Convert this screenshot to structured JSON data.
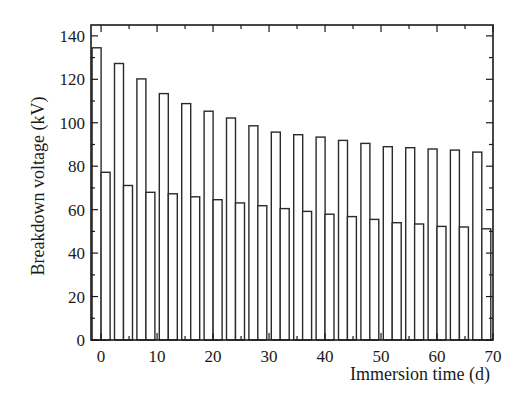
{
  "chart_data": {
    "type": "bar",
    "title": "",
    "xlabel": "Immersion time (d)",
    "ylabel": "Breakdown voltage (kV)",
    "xlim": [
      -1.8,
      70
    ],
    "ylim": [
      0,
      145
    ],
    "xticks": [
      0,
      10,
      20,
      30,
      40,
      50,
      60,
      70
    ],
    "xminor_step": 5,
    "yticks": [
      0,
      20,
      40,
      60,
      80,
      100,
      120,
      140
    ],
    "yminor_step": 10,
    "grid": false,
    "legend": null,
    "bar_width_days": 1.6,
    "x": [
      -0.8,
      3.2,
      7.2,
      11.2,
      15.2,
      19.2,
      23.2,
      27.2,
      31.2,
      35.2,
      39.2,
      43.2,
      47.2,
      51.2,
      55.2,
      59.2,
      63.2,
      67.2
    ],
    "series": [
      {
        "name": "Series A (higher)",
        "offset": -0.8,
        "values": [
          134.5,
          127.3,
          120.2,
          113.4,
          108.8,
          105.3,
          102.2,
          98.6,
          95.7,
          94.5,
          93.4,
          91.9,
          90.5,
          89.0,
          88.5,
          87.9,
          87.4,
          86.5
        ]
      },
      {
        "name": "Series B (lower)",
        "offset": 0.8,
        "values": [
          77.2,
          71.1,
          68.0,
          67.3,
          65.9,
          64.6,
          63.1,
          61.8,
          60.5,
          59.2,
          57.9,
          56.8,
          55.5,
          54.0,
          53.4,
          52.3,
          52.0,
          51.2
        ]
      }
    ]
  },
  "colors": {
    "bar_stroke": "#2a2a2a",
    "bar_fill": "#ffffff",
    "axis": "#1a1a1a",
    "background": "#ffffff"
  }
}
